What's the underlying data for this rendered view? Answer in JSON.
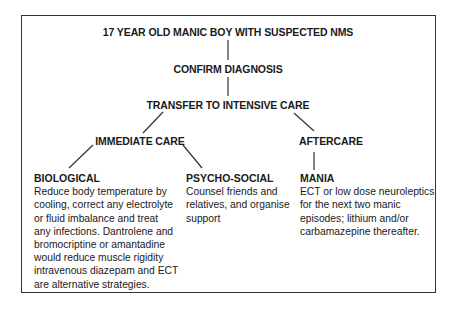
{
  "diagram": {
    "root": "17 YEAR OLD MANIC BOY WITH SUSPECTED NMS",
    "step2": "CONFIRM DIAGNOSIS",
    "step3": "TRANSFER TO INTENSIVE CARE",
    "branches": {
      "immediate": "IMMEDIATE CARE",
      "after": "AFTERCARE"
    },
    "leaves": {
      "biological": {
        "title": "BIOLOGICAL",
        "text": "Reduce body temperature by\ncooling, correct any electrolyte\nor fluid imbalance and treat\nany infections. Dantrolene and\nbromocriptine or amantadine\nwould reduce muscle rigidity\n intravenous diazepam and ECT\nare alternative strategies."
      },
      "psychosocial": {
        "title": "PSYCHO-SOCIAL",
        "text": "Counsel friends and\nrelatives, and organise\n support"
      },
      "mania": {
        "title": "MANIA",
        "text": "ECT or low dose neuroleptics\nfor the next two manic\nepisodes; lithium and/or\ncarbamazepine thereafter."
      }
    },
    "colors": {
      "line": "#333333",
      "text": "#1a1a1a",
      "background": "#ffffff"
    }
  }
}
